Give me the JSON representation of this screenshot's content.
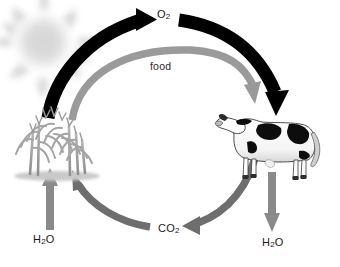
{
  "diagram": {
    "background_color": "#ffffff",
    "colors": {
      "oxygen_arrow": "#000000",
      "food_arrow": "#9a9a9a",
      "co2_arrow": "#6e6e6e",
      "water_arrow": "#8a8a8a",
      "sun": "#dcdcdc",
      "label_text": "#1a1a1a"
    },
    "labels": {
      "oxygen": "O",
      "oxygen_sub": "2",
      "food": "food",
      "carbon_dioxide": "CO",
      "carbon_dioxide_sub": "2",
      "water_left": "H",
      "water_left_sub": "2",
      "water_left_tail": "O",
      "water_right": "H",
      "water_right_sub": "2",
      "water_right_tail": "O"
    },
    "objects": [
      {
        "name": "sun",
        "description": "faint blurred sun with rays, top-left corner"
      },
      {
        "name": "corn-plant",
        "description": "grayscale corn stalks on ground strip, left side"
      },
      {
        "name": "cow",
        "description": "black and white Holstein cow facing left, right side"
      }
    ],
    "flows": [
      {
        "name": "oxygen-flow",
        "from": "plant",
        "to": "cow",
        "label": "O2",
        "color": "black",
        "style": "thick curved arc over the top"
      },
      {
        "name": "food-flow",
        "from": "plant",
        "to": "cow",
        "label": "food",
        "color": "gray",
        "style": "curved arc under the oxygen arc"
      },
      {
        "name": "carbon-dioxide-flow",
        "from": "cow",
        "to": "plant",
        "label": "CO2",
        "color": "gray",
        "style": "curved arc along the bottom"
      },
      {
        "name": "water-input-flow",
        "to": "plant",
        "label": "H2O",
        "color": "gray",
        "style": "straight vertical arrow upward"
      },
      {
        "name": "water-output-flow",
        "from": "cow",
        "label": "H2O",
        "color": "gray",
        "style": "straight vertical arrow downward"
      }
    ]
  }
}
